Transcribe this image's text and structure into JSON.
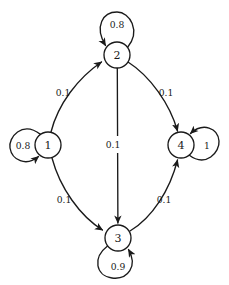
{
  "diagram": {
    "kind": "markov-chain-state-transition-diagram",
    "background_color": "#ffffff",
    "stroke_color": "#1a1a1a",
    "width": 229,
    "height": 285,
    "nodes": [
      {
        "id": "1",
        "label": "1",
        "cx": 48,
        "cy": 145,
        "r": 13
      },
      {
        "id": "2",
        "label": "2",
        "cx": 117,
        "cy": 55,
        "r": 13
      },
      {
        "id": "3",
        "label": "3",
        "cx": 118,
        "cy": 238,
        "r": 13
      },
      {
        "id": "4",
        "label": "4",
        "cx": 181,
        "cy": 145,
        "r": 13
      }
    ],
    "self_loops": [
      {
        "id": "loop-1",
        "node": "1",
        "label": "0.8",
        "side": "left",
        "label_x": 23,
        "label_y": 145
      },
      {
        "id": "loop-2",
        "node": "2",
        "label": "0.8",
        "side": "top",
        "label_x": 117,
        "label_y": 24
      },
      {
        "id": "loop-3",
        "node": "3",
        "label": "0.9",
        "side": "bottom",
        "label_x": 118,
        "label_y": 266
      },
      {
        "id": "loop-4",
        "node": "4",
        "label": "1",
        "side": "right",
        "label_x": 207,
        "label_y": 145
      }
    ],
    "edges": [
      {
        "id": "edge-1-2",
        "from": "1",
        "to": "2",
        "label": "0.1",
        "label_x": 63,
        "label_y": 92
      },
      {
        "id": "edge-2-4",
        "from": "2",
        "to": "4",
        "label": "0.1",
        "label_x": 166,
        "label_y": 92
      },
      {
        "id": "edge-1-3",
        "from": "1",
        "to": "3",
        "label": "0.1",
        "label_x": 64,
        "label_y": 199
      },
      {
        "id": "edge-3-4",
        "from": "3",
        "to": "4",
        "label": "0.1",
        "label_x": 164,
        "label_y": 199
      },
      {
        "id": "edge-2-3",
        "from": "2",
        "to": "3",
        "label": "0.1",
        "label_x": 113,
        "label_y": 144
      }
    ]
  }
}
